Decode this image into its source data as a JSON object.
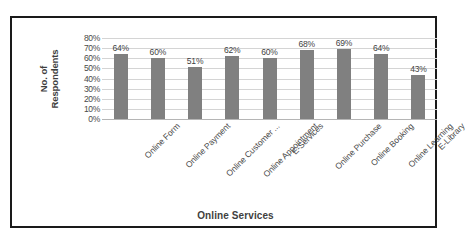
{
  "chart_data": {
    "type": "bar",
    "title": "",
    "xlabel": "Online Services",
    "ylabel": "No. of Respondents",
    "ylabel_lines": [
      "No. of",
      "Respondents"
    ],
    "categories": [
      "Online Form",
      "Online Payment",
      "Online Customer ...",
      "Online Appointment",
      "E-Services",
      "Online Purchase",
      "Online Booking",
      "Online Learning",
      "E-Library"
    ],
    "values": [
      64,
      60,
      51,
      62,
      60,
      68,
      69,
      64,
      43
    ],
    "data_labels": [
      "64%",
      "60%",
      "51%",
      "62%",
      "60%",
      "68%",
      "69%",
      "64%",
      "43%"
    ],
    "ylim": [
      0,
      80
    ],
    "ytick_values": [
      80,
      70,
      60,
      50,
      40,
      30,
      20,
      10,
      0
    ],
    "ytick_labels": [
      "80%",
      "70%",
      "60%",
      "50%",
      "40%",
      "30%",
      "20%",
      "10%",
      "0%"
    ],
    "grid": true,
    "legend": "none",
    "bar_color": "#808080",
    "gridline_color": "#d4d4d4",
    "frame_color": "#1a1a1a",
    "background_color": "#ffffff",
    "text_color": "#3f3f3f"
  }
}
